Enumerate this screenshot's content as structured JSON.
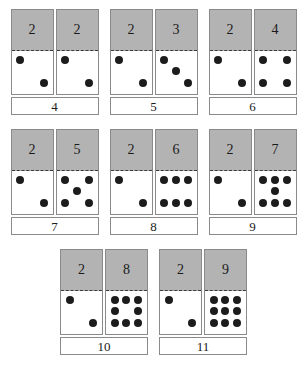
{
  "worksheet": {
    "title": "Domino Addition Cards",
    "addend_fixed": "2",
    "dot_color": "#1c1c1c",
    "card_top_color": "#b3b3b3",
    "card_border_color": "#8a8a8a",
    "background_color": "#ffffff"
  },
  "rows": [
    {
      "problems": [
        {
          "left": {
            "numeral": "2",
            "dots": 2
          },
          "right": {
            "numeral": "2",
            "dots": 2
          },
          "sum": "4"
        },
        {
          "left": {
            "numeral": "2",
            "dots": 2
          },
          "right": {
            "numeral": "3",
            "dots": 3
          },
          "sum": "5"
        },
        {
          "left": {
            "numeral": "2",
            "dots": 2
          },
          "right": {
            "numeral": "4",
            "dots": 4
          },
          "sum": "6"
        }
      ]
    },
    {
      "problems": [
        {
          "left": {
            "numeral": "2",
            "dots": 2
          },
          "right": {
            "numeral": "5",
            "dots": 5
          },
          "sum": "7"
        },
        {
          "left": {
            "numeral": "2",
            "dots": 2
          },
          "right": {
            "numeral": "6",
            "dots": 6
          },
          "sum": "8"
        },
        {
          "left": {
            "numeral": "2",
            "dots": 2
          },
          "right": {
            "numeral": "7",
            "dots": 7
          },
          "sum": "9"
        }
      ]
    },
    {
      "problems": [
        {
          "left": {
            "numeral": "2",
            "dots": 2
          },
          "right": {
            "numeral": "8",
            "dots": 8
          },
          "sum": "10"
        },
        {
          "left": {
            "numeral": "2",
            "dots": 2
          },
          "right": {
            "numeral": "9",
            "dots": 9
          },
          "sum": "11"
        }
      ]
    }
  ],
  "pip_layouts": {
    "2": [
      0,
      0,
      0,
      0,
      0,
      0,
      0,
      0,
      0
    ],
    "note": "pip placement handled by renderer using face maps below",
    "faces": {
      "2": [
        1,
        0,
        0,
        0,
        0,
        0,
        0,
        0,
        1
      ],
      "3": [
        1,
        0,
        0,
        0,
        1,
        0,
        0,
        0,
        1
      ],
      "4": [
        1,
        0,
        1,
        0,
        0,
        0,
        1,
        0,
        1
      ],
      "5": [
        1,
        0,
        1,
        0,
        1,
        0,
        1,
        0,
        1
      ],
      "6": [
        1,
        1,
        1,
        0,
        0,
        0,
        1,
        1,
        1
      ],
      "7": [
        1,
        1,
        1,
        0,
        1,
        0,
        1,
        1,
        1
      ],
      "8": [
        1,
        1,
        1,
        1,
        0,
        1,
        1,
        1,
        1
      ],
      "9": [
        1,
        1,
        1,
        1,
        1,
        1,
        1,
        1,
        1
      ]
    }
  }
}
